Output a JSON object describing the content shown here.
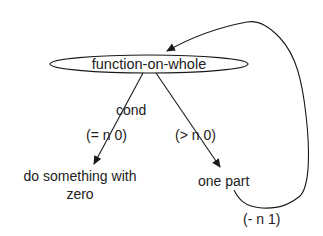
{
  "diagram": {
    "type": "flow / recursion tree",
    "root_node": {
      "id": "function-on-whole",
      "label": "function-on-whole",
      "shape": "ellipse"
    },
    "condition_label": "cond",
    "branches": [
      {
        "id": "base-case",
        "condition": "(= n 0)",
        "target_label_line1": "do something with",
        "target_label_line2": "zero"
      },
      {
        "id": "recursive-case",
        "condition": "(> n 0)",
        "target_label": "one part"
      }
    ],
    "recursion_edge": {
      "from": "one part",
      "to": "function-on-whole",
      "label": "(- n 1)"
    },
    "colors": {
      "stroke": "#1a1a1a",
      "text": "#222222",
      "background": "#ffffff"
    }
  }
}
